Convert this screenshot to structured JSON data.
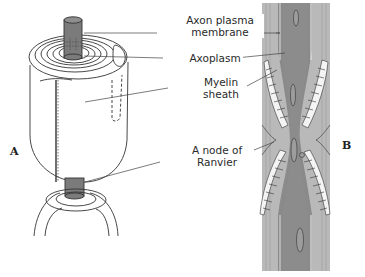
{
  "figure": {
    "panels": [
      {
        "id": "A",
        "letter": "A",
        "description": "3D cutaway of myelinated axon showing concentric myelin wraps"
      },
      {
        "id": "B",
        "letter": "B",
        "description": "Longitudinal section of myelinated axon at a node of Ranvier"
      }
    ],
    "labels": {
      "axon_plasma_membrane_line1": "Axon plasma",
      "axon_plasma_membrane_line2": "membrane",
      "axoplasm": "Axoplasm",
      "myelin_sheath_line1": "Myelin",
      "myelin_sheath_line2": "sheath",
      "node_of_ranvier_line1": "A node of",
      "node_of_ranvier_line2": "Ranvier"
    },
    "colors": {
      "axon_fill": "#7b7b7b",
      "section_fill": "#8c8c8c",
      "section_light": "#b5b5b5",
      "line": "#333333",
      "background": "#ffffff"
    }
  }
}
